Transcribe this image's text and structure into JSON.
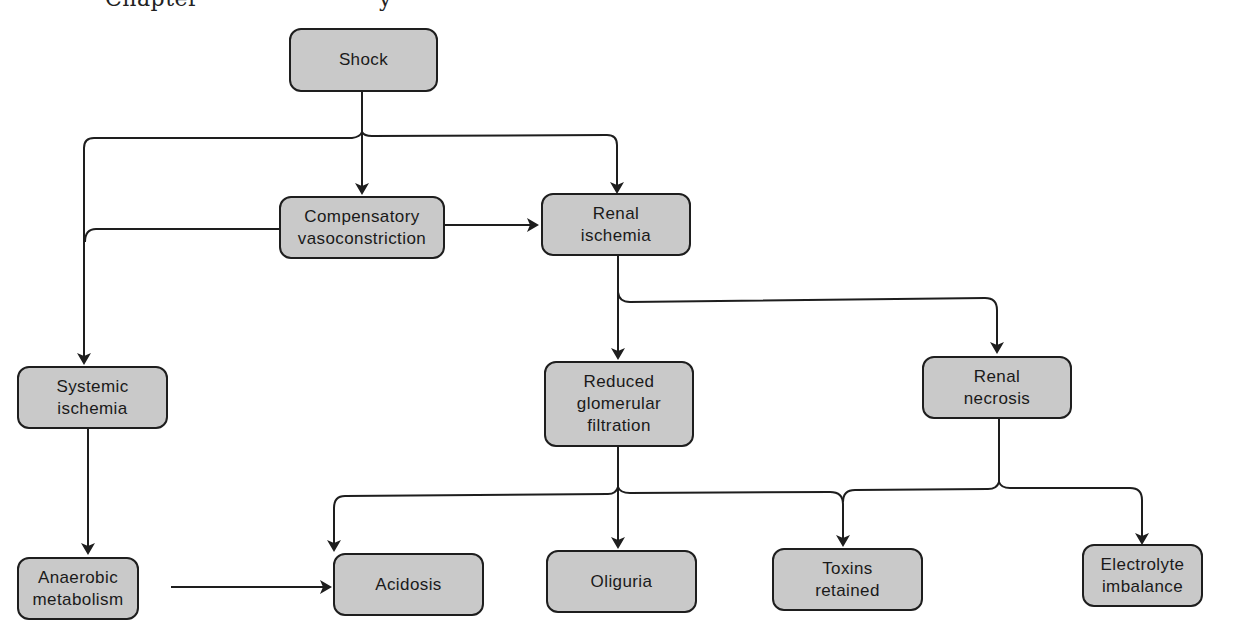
{
  "header": {
    "text_left": "Chapter",
    "text_right": "y"
  },
  "colors": {
    "node_fill": "#c9c9c9",
    "node_border": "#1e1e1e",
    "edge": "#1e1e1e",
    "background": "#ffffff"
  },
  "nodes": {
    "shock": {
      "label": "Shock"
    },
    "compensatory_vasoconstriction": {
      "label": "Compensatory\nvasoconstriction"
    },
    "renal_ischemia": {
      "label": "Renal\nischemia"
    },
    "systemic_ischemia": {
      "label": "Systemic\nischemia"
    },
    "reduced_glomerular_filtration": {
      "label": "Reduced\nglomerular\nfiltration"
    },
    "renal_necrosis": {
      "label": "Renal\nnecrosis"
    },
    "anaerobic_metabolism": {
      "label": "Anaerobic\nmetabolism"
    },
    "acidosis": {
      "label": "Acidosis"
    },
    "oliguria": {
      "label": "Oliguria"
    },
    "toxins_retained": {
      "label": "Toxins\nretained"
    },
    "electrolyte_imbalance": {
      "label": "Electrolyte\nimbalance"
    }
  },
  "edges": [
    {
      "from": "Shock",
      "to": "Systemic ischemia"
    },
    {
      "from": "Shock",
      "to": "Compensatory vasoconstriction"
    },
    {
      "from": "Shock",
      "to": "Renal ischemia"
    },
    {
      "from": "Compensatory vasoconstriction",
      "to": "Renal ischemia"
    },
    {
      "from": "Compensatory vasoconstriction",
      "to": "Systemic ischemia"
    },
    {
      "from": "Renal ischemia",
      "to": "Reduced glomerular filtration"
    },
    {
      "from": "Renal ischemia",
      "to": "Renal necrosis"
    },
    {
      "from": "Systemic ischemia",
      "to": "Anaerobic metabolism"
    },
    {
      "from": "Anaerobic metabolism",
      "to": "Acidosis"
    },
    {
      "from": "Reduced glomerular filtration",
      "to": "Acidosis"
    },
    {
      "from": "Reduced glomerular filtration",
      "to": "Oliguria"
    },
    {
      "from": "Reduced glomerular filtration",
      "to": "Toxins retained"
    },
    {
      "from": "Renal necrosis",
      "to": "Toxins retained"
    },
    {
      "from": "Renal necrosis",
      "to": "Electrolyte imbalance"
    }
  ]
}
